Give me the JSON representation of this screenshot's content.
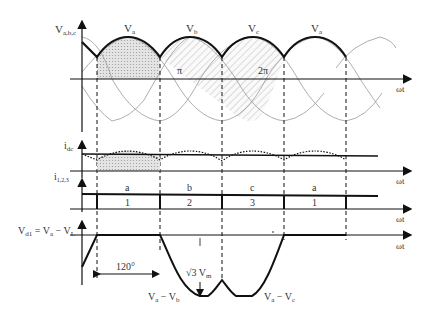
{
  "diagram": {
    "top_plot": {
      "y_label": "V",
      "y_label_sub": "a,b,c",
      "x_label": "ωt",
      "phase_labels": [
        {
          "main": "V",
          "sub": "a"
        },
        {
          "main": "V",
          "sub": "b"
        },
        {
          "main": "V",
          "sub": "c"
        },
        {
          "main": "V",
          "sub": "a"
        }
      ],
      "angle_marks": [
        "π",
        "2π"
      ]
    },
    "idc_plot": {
      "y_label": "i",
      "y_label_sub": "dc",
      "x_label": "ωt"
    },
    "i123_plot": {
      "y_label": "i",
      "y_label_sub": "1,2,3",
      "x_label": "ωt",
      "phase_letters": [
        "a",
        "b",
        "c",
        "a"
      ],
      "diode_numbers": [
        "1",
        "2",
        "3",
        "1"
      ]
    },
    "vd1_plot": {
      "y_label_main": "V",
      "y_label_sub": "d1",
      "y_label_eq": " = V",
      "y_label_eq_sub": "a",
      "y_label_minus": " − V",
      "y_label_minus_sub": "L",
      "x_label": "ωt",
      "interval_label": "120°",
      "peak_label_root": "√3",
      "peak_label_v": " V",
      "peak_label_sub": "m",
      "segment_left": {
        "a": "V",
        "a_sub": "a",
        "op": " − V",
        "b_sub": "b"
      },
      "segment_right": {
        "a": "V",
        "a_sub": "a",
        "op": " − V",
        "b_sub": "c"
      }
    }
  }
}
